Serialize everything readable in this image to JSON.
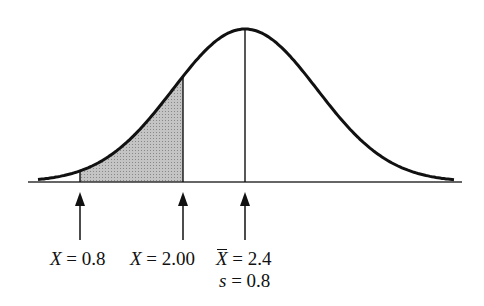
{
  "diagram": {
    "type": "normal-distribution",
    "mean": 2.4,
    "sd": 0.8,
    "shaded_region": {
      "from": 0.8,
      "to": 2.0
    },
    "colors": {
      "curve": "#111111",
      "shade": "#b0b0b0",
      "background": "#ffffff"
    }
  },
  "labels": {
    "x1": {
      "var": "X",
      "eq": " = 0.8"
    },
    "x2": {
      "var": "X",
      "eq": " = 2.00"
    },
    "mean": {
      "var": "X",
      "eq": " = 2.4"
    },
    "sd": {
      "var": "s",
      "eq": " = 0.8"
    }
  }
}
